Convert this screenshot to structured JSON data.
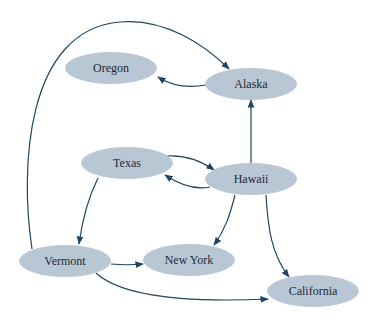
{
  "diagram": {
    "type": "directed-graph",
    "colors": {
      "node_fill": "#b9c7d4",
      "edge": "#1f4563",
      "label": "#1e2a36",
      "background": "#ffffff"
    },
    "nodes": [
      {
        "id": "oregon",
        "label": "Oregon"
      },
      {
        "id": "alaska",
        "label": "Alaska"
      },
      {
        "id": "texas",
        "label": "Texas"
      },
      {
        "id": "hawaii",
        "label": "Hawaii"
      },
      {
        "id": "vermont",
        "label": "Vermont"
      },
      {
        "id": "new_york",
        "label": "New York"
      },
      {
        "id": "california",
        "label": "California"
      }
    ],
    "edges": [
      {
        "from": "Vermont",
        "to": "Alaska"
      },
      {
        "from": "Alaska",
        "to": "Oregon"
      },
      {
        "from": "Hawaii",
        "to": "Alaska"
      },
      {
        "from": "Texas",
        "to": "Hawaii"
      },
      {
        "from": "Hawaii",
        "to": "Texas"
      },
      {
        "from": "Texas",
        "to": "Vermont"
      },
      {
        "from": "Hawaii",
        "to": "New York"
      },
      {
        "from": "Hawaii",
        "to": "California"
      },
      {
        "from": "Vermont",
        "to": "New York"
      },
      {
        "from": "Vermont",
        "to": "California"
      }
    ]
  }
}
